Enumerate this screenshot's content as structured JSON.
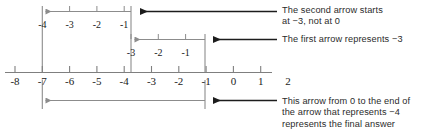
{
  "diagram": {
    "axis": {
      "labels": [
        "-8",
        "-7",
        "-6",
        "-5",
        "-4",
        "-3",
        "-2",
        "-1",
        "0",
        "1",
        "2"
      ],
      "values": [
        -8,
        -7,
        -6,
        -5,
        -4,
        -3,
        -2,
        -1,
        0,
        1,
        2
      ],
      "origin_value": 0,
      "min": -8,
      "max": 2
    },
    "arrows": [
      {
        "id": "second-arrow",
        "label": "second arrow",
        "from": -3,
        "to": -7,
        "represents": "-4",
        "tick_labels": [
          "-4",
          "-3",
          "-2",
          "-1"
        ],
        "tick_values": [
          -7,
          -6,
          -5,
          -4
        ],
        "color": "#8c8c8c"
      },
      {
        "id": "first-arrow",
        "label": "first arrow",
        "from": 0,
        "to": -3,
        "represents": "-3",
        "tick_labels": [
          "-3",
          "-2",
          "-1"
        ],
        "tick_values": [
          -3,
          -2,
          -1
        ],
        "color": "#8c8c8c"
      },
      {
        "id": "answer-arrow",
        "label": "answer arrow",
        "from": 0,
        "to": -7,
        "represents": "-7",
        "tick_labels": [],
        "tick_values": [],
        "color": "#8c8c8c"
      }
    ],
    "annotations": [
      {
        "id": "annotation-second-arrow",
        "text": "The second arrow starts\nat −3, not at 0",
        "pointer_color": "#1c1c1c"
      },
      {
        "id": "annotation-first-arrow",
        "text": "The first arrow represents −3",
        "pointer_color": "#1c1c1c"
      },
      {
        "id": "annotation-answer-arrow",
        "text": "This arrow from 0 to the end of\nthe arrow that represents −4\nrepresents the final answer",
        "pointer_color": "#1c1c1c"
      }
    ],
    "colors": {
      "axis": "#7f7f7f",
      "arrow": "#8c8c8c",
      "pointer": "#1c1c1c",
      "text": "#2b2b2b",
      "background": "#ffffff"
    }
  }
}
